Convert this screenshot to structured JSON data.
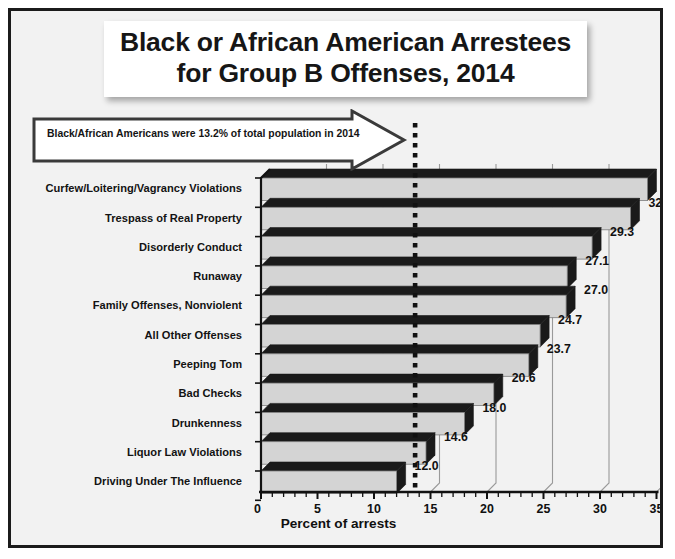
{
  "title": {
    "line1": "Black or African American Arrestees",
    "line2": "for Group B Offenses, 2014"
  },
  "callout": {
    "text": "Black/African Americans were 13.2% of total population in 2014",
    "value": 13.2,
    "shape": "right-arrow-callout"
  },
  "colors": {
    "background": "#f2f2f2",
    "frame_border": "#1b1b1b",
    "bar_face": "#d4d4d4",
    "bar_shadow": "#1a1a1a",
    "gridline": "#9a9a9a",
    "axis": "#111111",
    "reference_line": "#111111",
    "title_box": "#ffffff"
  },
  "chart_data": {
    "type": "bar",
    "orientation": "horizontal",
    "title": "Black or African American Arrestees for Group B Offenses, 2014",
    "xlabel": "Percent of arrests",
    "ylabel": "",
    "xlim": [
      0,
      35
    ],
    "xticks": [
      0,
      5,
      10,
      15,
      20,
      25,
      30,
      35
    ],
    "xtick_labels": [
      "0",
      "5",
      "10",
      "15",
      "20",
      "25",
      "30",
      "35"
    ],
    "minor_ticks": true,
    "grid": "vertical-major",
    "legend": "none",
    "reference_line": {
      "value": 13.2,
      "style": "dotted",
      "label": "Black/African Americans were 13.2% of total population in 2014"
    },
    "categories": [
      "Curfew/Loitering/Vagrancy Violations",
      "Trespass of Real Property",
      "Disorderly Conduct",
      "Runaway",
      "Family Offenses, Nonviolent",
      "All Other Offenses",
      "Peeping Tom",
      "Bad Checks",
      "Drunkenness",
      "Liquor Law Violations",
      "Driving Under The Influence"
    ],
    "values": [
      34.2,
      32.7,
      29.3,
      27.1,
      27.0,
      24.7,
      23.7,
      20.6,
      18.0,
      14.6,
      12.0
    ],
    "value_labels": [
      "34.2",
      "32.7",
      "29.3",
      "27.1",
      "27.0",
      "24.7",
      "23.7",
      "20.6",
      "18.0",
      "14.6",
      "12.0"
    ]
  }
}
